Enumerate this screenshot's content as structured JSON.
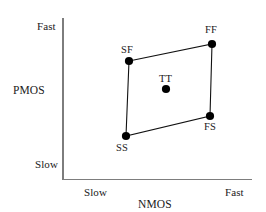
{
  "chart_data": {
    "type": "scatter",
    "title": "",
    "xlabel": "NMOS",
    "ylabel": "PMOS",
    "xticks": [
      "Slow",
      "Fast"
    ],
    "yticks": [
      "Slow",
      "Fast"
    ],
    "grid": false,
    "legend": null,
    "annotations": [
      "SF",
      "FF",
      "TT",
      "SS",
      "FS"
    ],
    "points": [
      {
        "label": "SF",
        "x": 129,
        "y": 61,
        "nmos": "Slow",
        "pmos": "Fast"
      },
      {
        "label": "FF",
        "x": 212,
        "y": 44,
        "nmos": "Fast",
        "pmos": "Fast"
      },
      {
        "label": "TT",
        "x": 166,
        "y": 89,
        "nmos": "Typical",
        "pmos": "Typical"
      },
      {
        "label": "SS",
        "x": 126,
        "y": 136,
        "nmos": "Slow",
        "pmos": "Slow"
      },
      {
        "label": "FS",
        "x": 210,
        "y": 116,
        "nmos": "Fast",
        "pmos": "Slow"
      }
    ],
    "polygon_order": [
      "SF",
      "FF",
      "FS",
      "SS"
    ],
    "colors": {
      "axis": "#7d7d7d",
      "edge": "#111111",
      "dot": "#000000",
      "background": "#ffffff"
    }
  },
  "axes": {
    "y": {
      "name": "PMOS",
      "high_label": "Fast",
      "low_label": "Slow"
    },
    "x": {
      "name": "NMOS",
      "low_label": "Slow",
      "high_label": "Fast"
    }
  },
  "points": {
    "sf": "SF",
    "ff": "FF",
    "tt": "TT",
    "ss": "SS",
    "fs": "FS"
  }
}
